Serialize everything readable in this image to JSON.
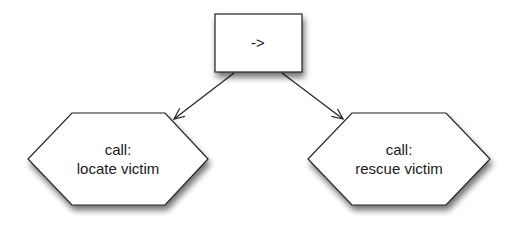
{
  "diagram": {
    "root": {
      "label": "->",
      "shape": "rectangle"
    },
    "children": [
      {
        "line1": "call:",
        "line2": "locate victim",
        "shape": "hexagon"
      },
      {
        "line1": "call:",
        "line2": "rescue victim",
        "shape": "hexagon"
      }
    ],
    "edges": [
      {
        "from": "->",
        "to": "call: locate victim"
      },
      {
        "from": "->",
        "to": "call: rescue victim"
      }
    ],
    "colors": {
      "stroke": "#222222",
      "fill": "#ffffff",
      "shadow": "#888888"
    }
  }
}
